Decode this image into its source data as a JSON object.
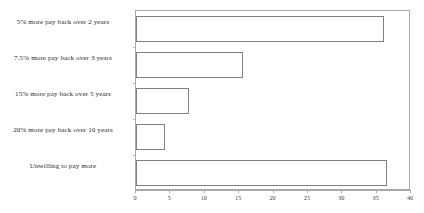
{
  "chart_data": {
    "type": "bar",
    "orientation": "horizontal",
    "title": "",
    "subtitle": "",
    "xlabel": "",
    "ylabel": "",
    "categories": [
      "5% more pay back over 2 years",
      "7.5% more pay back over 3 years",
      "15% more pay back over 5 years",
      "20% more pay back over 10 years",
      "Unwilling to pay more"
    ],
    "values": [
      36,
      15.5,
      7.7,
      4.2,
      36.5
    ],
    "xlim": [
      0,
      40
    ],
    "xticks": [
      0,
      5,
      10,
      15,
      20,
      25,
      30,
      35,
      40
    ],
    "xtick_labels": [
      "0",
      "5",
      "10",
      "15",
      "20",
      "25",
      "30",
      "35",
      "40"
    ],
    "grid": false,
    "legend": false,
    "bar_fill_color": "#ffffff",
    "bar_border_color": "#808080",
    "axis_color": "#a8a8a8",
    "text_color": "#2b2b2b"
  }
}
